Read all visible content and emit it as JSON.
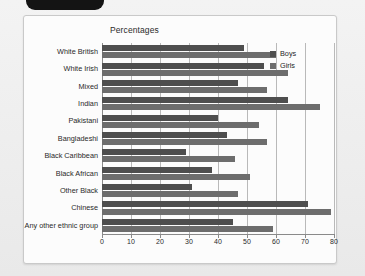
{
  "window": {
    "tab_icon": "black-rounded-tab"
  },
  "chart_data": {
    "type": "bar",
    "orientation": "horizontal",
    "title": "Percentages",
    "xlabel": "",
    "ylabel": "",
    "xlim": [
      0,
      80
    ],
    "xticks": [
      0,
      10,
      20,
      30,
      40,
      50,
      60,
      70,
      80
    ],
    "grid": true,
    "legend_position": "top-right",
    "categories": [
      "White British",
      "White Irish",
      "Mixed",
      "Indian",
      "Pakistani",
      "Bangladeshi",
      "Black Caribbean",
      "Black African",
      "Other Black",
      "Chinese",
      "Any other ethnic group"
    ],
    "series": [
      {
        "name": "Boys",
        "color": "#4e4e4e",
        "values": [
          49,
          56,
          47,
          64,
          40,
          43,
          29,
          38,
          31,
          71,
          45
        ]
      },
      {
        "name": "Girls",
        "color": "#6d6d6d",
        "values": [
          60,
          64,
          57,
          75,
          54,
          57,
          46,
          51,
          47,
          79,
          59
        ]
      }
    ]
  },
  "colors": {
    "boys": "#4e4e4e",
    "girls": "#6d6d6d",
    "grid": "#b9b9b9",
    "axis": "#8a8a8a",
    "card_background": "#fcfcfc",
    "page_background": "#efefef"
  }
}
